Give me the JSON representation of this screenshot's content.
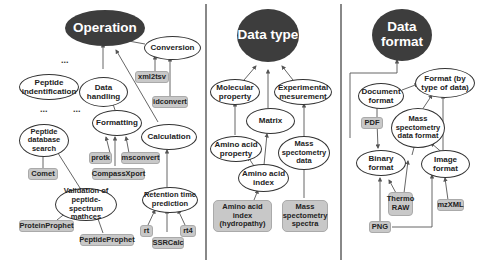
{
  "panels": {
    "operation": {
      "root": "Operation",
      "nodes": {
        "peptide_identification": "Peptide indentification",
        "data_handling": "Data handling",
        "conversion": "Conversion",
        "peptide_database_search": "Peptide database search",
        "formatting": "Formatting",
        "calculation": "Calculation",
        "validation": "Validation of peptide-spectrum mathces",
        "retention_time": "Retention time prediction"
      },
      "tools": {
        "xml2tsv": "xml2tsv",
        "idconvert": "idconvert",
        "comet": "Comet",
        "protk": "protk",
        "msconvert": "msconvert",
        "compassxport": "CompassXport",
        "proteinprophet": "ProteinProphet",
        "peptideprophet": "PeptideProphet",
        "rt": "rt",
        "rt4": "rt4",
        "ssrcalc": "SSRCalc"
      },
      "ellipsis": "..."
    },
    "data_type": {
      "root": "Data type",
      "nodes": {
        "molecular_property": "Molecular property",
        "matrix": "Matrix",
        "experimental_measurement": "Experimental mesurement",
        "amino_acid_property": "Amino acid property",
        "amino_acid_index": "Amino acid index",
        "ms_data": "Mass spectometry data"
      },
      "tools": {
        "aa_index_hydropathy": "Amino acid index (hydropathy)",
        "ms_spectra": "Mass spectometry spectra"
      }
    },
    "data_format": {
      "root": "Data format",
      "nodes": {
        "format_by_type": "Format (by type of data)",
        "document_format": "Document format",
        "ms_data_format": "Mass spectometry data format",
        "binary_format": "Binary format",
        "image_format": "Image format"
      },
      "tools": {
        "pdf": "PDF",
        "thermo_raw": "Thermo RAW",
        "mzxml": "mzXML",
        "png": "PNG"
      }
    }
  },
  "colors": {
    "root_fill": "#3d3d3d",
    "tool_fill": "#c8c8c8",
    "edge": "#555555",
    "divider": "#888888"
  }
}
